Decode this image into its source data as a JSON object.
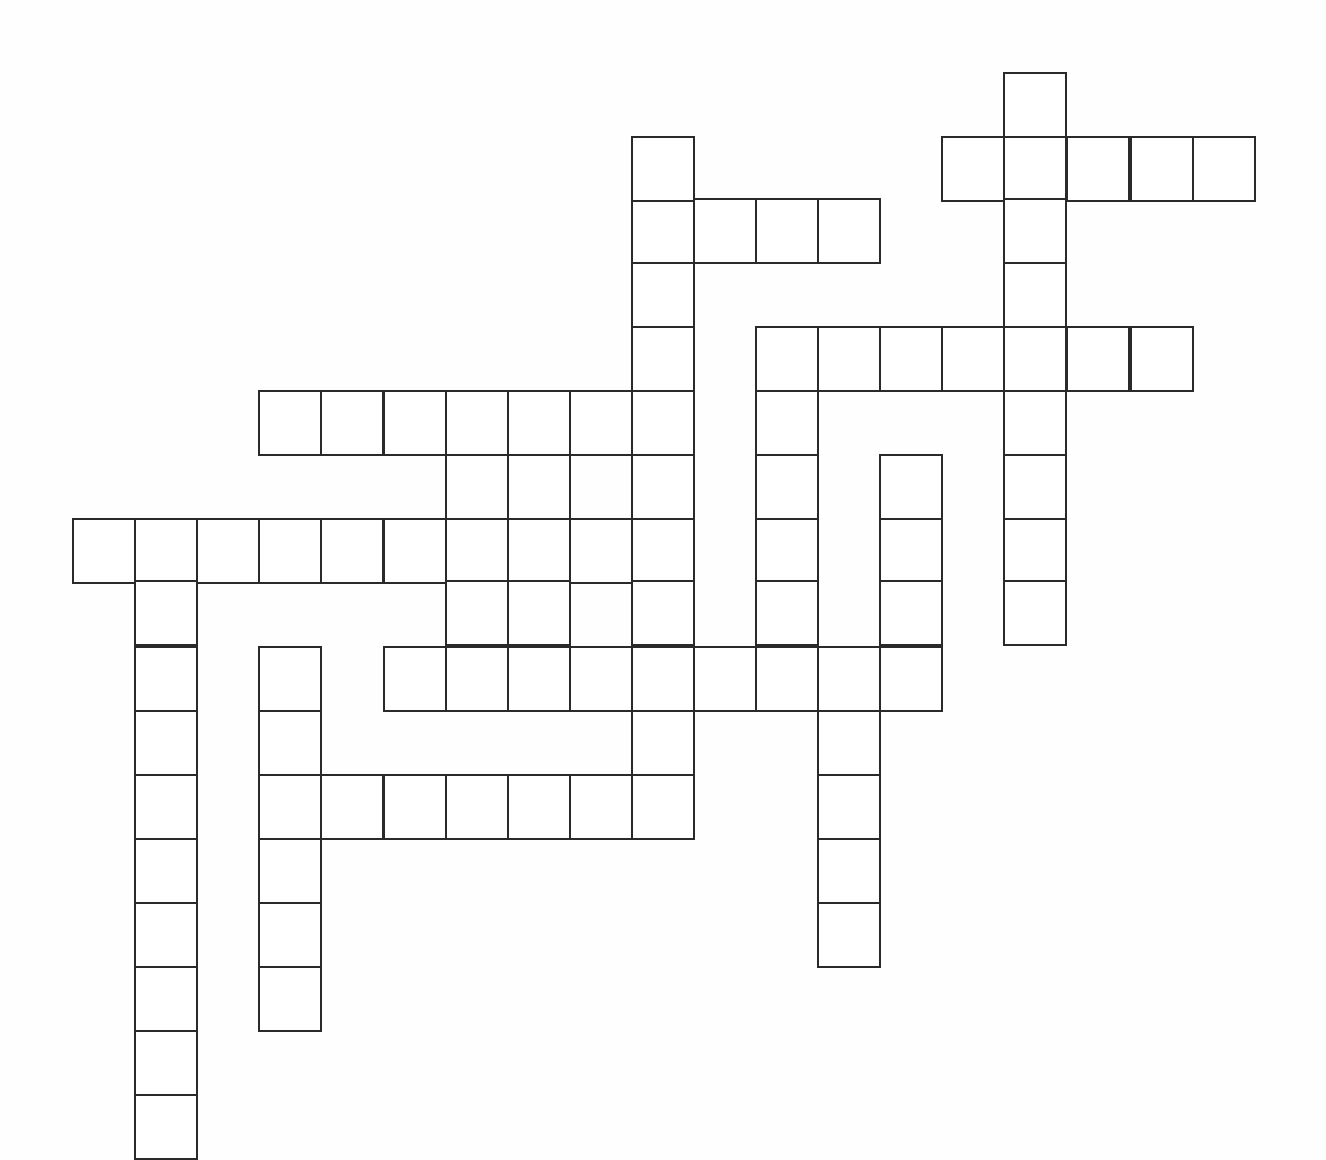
{
  "puzzle": {
    "type": "crossword",
    "grid_origin": {
      "x": 72,
      "y": 72
    },
    "cell_size": {
      "w": 62,
      "h": 64
    },
    "border_color": "#2a2a2a",
    "background": "#fefefe",
    "across": [
      {
        "row": 1,
        "col": 14,
        "length": 5
      },
      {
        "row": 2,
        "col": 9,
        "length": 4
      },
      {
        "row": 4,
        "col": 11,
        "length": 7
      },
      {
        "row": 5,
        "col": 3,
        "length": 7
      },
      {
        "row": 7,
        "col": 0,
        "length": 10
      },
      {
        "row": 9,
        "col": 5,
        "length": 9
      },
      {
        "row": 11,
        "col": 3,
        "length": 7
      }
    ],
    "down": [
      {
        "row": 0,
        "col": 15,
        "length": 9
      },
      {
        "row": 1,
        "col": 9,
        "length": 11
      },
      {
        "row": 4,
        "col": 11,
        "length": 6
      },
      {
        "row": 6,
        "col": 13,
        "length": 4
      },
      {
        "row": 9,
        "col": 12,
        "length": 5
      },
      {
        "row": 7,
        "col": 1,
        "length": 10
      },
      {
        "row": 9,
        "col": 3,
        "length": 6
      },
      {
        "row": 5,
        "col": 6,
        "length": 5
      },
      {
        "row": 5,
        "col": 7,
        "length": 5
      }
    ],
    "cells": []
  }
}
